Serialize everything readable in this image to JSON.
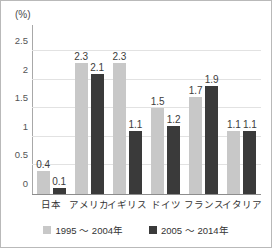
{
  "chart_data": {
    "type": "bar",
    "title": "",
    "xlabel": "",
    "ylabel": "(%)",
    "unit_label": "(%)",
    "categories": [
      "日本",
      "アメリカ",
      "イギリス",
      "ドイツ",
      "フランス",
      "イタリア"
    ],
    "series": [
      {
        "name": "1995 ～ 2004年",
        "color": "#c8c8c8",
        "values": [
          0.4,
          2.3,
          2.3,
          1.5,
          1.7,
          1.1
        ],
        "labels": [
          "0.4",
          "2.3",
          "2.3",
          "1.5",
          "1.7",
          "1.1"
        ]
      },
      {
        "name": "2005 ～ 2014年",
        "color": "#3a3a3a",
        "values": [
          0.1,
          2.1,
          1.1,
          1.2,
          1.9,
          1.1
        ],
        "labels": [
          "0.1",
          "2.1",
          "1.1",
          "1.2",
          "1.9",
          "1.1"
        ]
      }
    ],
    "ylim": [
      0,
      2.75
    ],
    "yticks": [
      0,
      0.5,
      1,
      1.5,
      2,
      2.5
    ],
    "ytick_labels": [
      "0",
      "0.5",
      "1",
      "1.5",
      "2",
      "2.5"
    ],
    "grid": true,
    "legend_position": "bottom"
  },
  "legend": {
    "items": [
      {
        "label": "1995 ～ 2004年",
        "color": "#c8c8c8"
      },
      {
        "label": "2005 ～ 2014年",
        "color": "#3a3a3a"
      }
    ]
  },
  "colors": {
    "series_1995_2004": "#c8c8c8",
    "series_2005_2014": "#3a3a3a",
    "gridline": "#e2e2e2",
    "axis": "#8d8d8d",
    "border": "#b9b9b9",
    "text": "#333333"
  }
}
